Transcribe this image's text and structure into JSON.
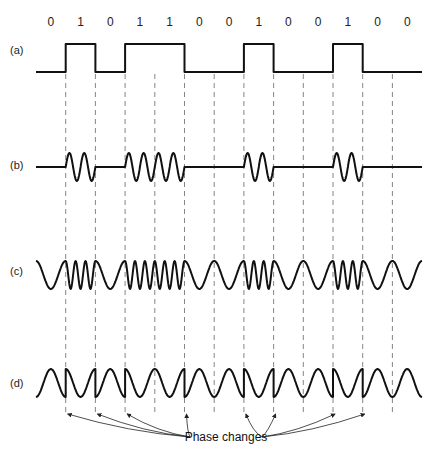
{
  "bits": [
    "0",
    "1",
    "0",
    "1",
    "1",
    "0",
    "0",
    "1",
    "0",
    "0",
    "1",
    "0",
    "0"
  ],
  "labels": {
    "a": "(a)",
    "b": "(b)",
    "c": "(c)",
    "d": "(d)"
  },
  "caption": "Phase changes",
  "diagram": {
    "rows": [
      {
        "id": "a",
        "description": "Binary data waveform (NRZ)"
      },
      {
        "id": "b",
        "description": "Amplitude-shift keying (on-off keying)"
      },
      {
        "id": "c",
        "description": "Frequency-shift keying"
      },
      {
        "id": "d",
        "description": "Phase-shift keying"
      }
    ],
    "bit_sequence": "0101100100100",
    "phase_change_count": 9
  }
}
